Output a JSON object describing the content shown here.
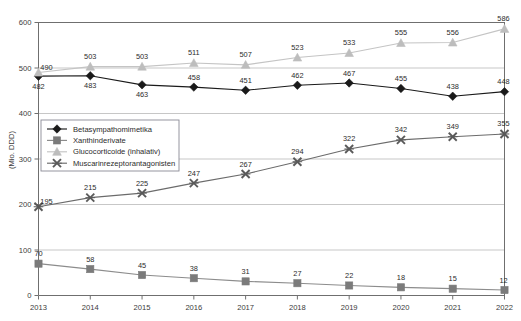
{
  "chart_data": {
    "type": "line",
    "title": "",
    "xlabel": "",
    "ylabel": "(Mio. DDD)",
    "ylim": [
      0,
      600
    ],
    "yticks": [
      0,
      100,
      200,
      300,
      400,
      500,
      600
    ],
    "grid": true,
    "legend_position": "inside-left",
    "categories": [
      "2013",
      "2014",
      "2015",
      "2016",
      "2017",
      "2018",
      "2019",
      "2020",
      "2021",
      "2022"
    ],
    "series": [
      {
        "name": "Betasympathomimetika",
        "marker": "diamond",
        "color": "#1a1a1a",
        "line_color": "#1a1a1a",
        "values": [
          482,
          483,
          463,
          458,
          451,
          462,
          467,
          455,
          438,
          448
        ],
        "label_positions": [
          "below",
          "below",
          "below",
          "above",
          "above",
          "above",
          "above",
          "above",
          "above",
          "above"
        ]
      },
      {
        "name": "Xanthinderivate",
        "marker": "square",
        "color": "#7b7b7b",
        "line_color": "#8c8c8c",
        "values": [
          70,
          58,
          45,
          38,
          31,
          27,
          22,
          18,
          15,
          12
        ],
        "label_positions": [
          "above",
          "above",
          "above",
          "above",
          "above",
          "above",
          "above",
          "above",
          "above",
          "above"
        ]
      },
      {
        "name": "Glucocorticoide (inhalativ)",
        "marker": "triangle",
        "color": "#bdbdbd",
        "line_color": "#c4c4c4",
        "values": [
          490,
          503,
          503,
          511,
          507,
          523,
          533,
          555,
          556,
          586
        ],
        "label_positions": [
          "right",
          "above",
          "above",
          "above",
          "above",
          "above",
          "above",
          "above",
          "above",
          "above"
        ]
      },
      {
        "name": "Muscarinrezeptorantagonisten",
        "marker": "x",
        "color": "#5a5a5a",
        "line_color": "#6b6b6b",
        "values": [
          195,
          215,
          225,
          247,
          267,
          294,
          322,
          342,
          349,
          355
        ],
        "label_positions": [
          "right",
          "above",
          "above",
          "above",
          "above",
          "above",
          "above",
          "above",
          "above",
          "above"
        ]
      }
    ]
  },
  "colors": {
    "background": "#ffffff",
    "axis": "#6f6f6f",
    "grid": "#b9b9b9",
    "text": "#2b2b2b"
  }
}
